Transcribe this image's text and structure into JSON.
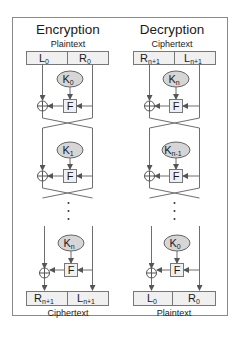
{
  "encryption": {
    "title": "Encryption",
    "input_label": "Plaintext",
    "output_label": "Ciphertext",
    "input_cells": [
      {
        "main": "L",
        "sub": "0"
      },
      {
        "main": "R",
        "sub": "0"
      }
    ],
    "output_cells": [
      {
        "main": "R",
        "sub": "n+1"
      },
      {
        "main": "L",
        "sub": "n+1"
      }
    ],
    "rounds": [
      {
        "key_main": "K",
        "key_sub": "0",
        "function": "F"
      },
      {
        "key_main": "K",
        "key_sub": "1",
        "function": "F"
      },
      {
        "key_main": "K",
        "key_sub": "n",
        "function": "F"
      }
    ]
  },
  "decryption": {
    "title": "Decryption",
    "input_label": "Ciphertext",
    "output_label": "Plaintext",
    "input_cells": [
      {
        "main": "R",
        "sub": "n+1"
      },
      {
        "main": "L",
        "sub": "n+1"
      }
    ],
    "output_cells": [
      {
        "main": "L",
        "sub": "0"
      },
      {
        "main": "R",
        "sub": "0"
      }
    ],
    "rounds": [
      {
        "key_main": "K",
        "key_sub": "n",
        "function": "F"
      },
      {
        "key_main": "K",
        "key_sub": "n-1",
        "function": "F"
      },
      {
        "key_main": "K",
        "key_sub": "0",
        "function": "F"
      }
    ]
  },
  "colors": {
    "line": "#6e6e6e",
    "cell_fill": "#f0f0f0",
    "key_fill": "#d6d6d6",
    "border": "#8a8a8a"
  }
}
